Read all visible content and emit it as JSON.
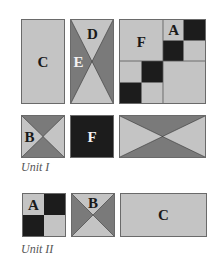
{
  "colors": {
    "light": "#c4c4c4",
    "medium": "#7a7a7a",
    "dark": "#1c1c1c",
    "border": "#6a6a6a"
  },
  "unit_1": {
    "caption": "Unit I",
    "blocks": {
      "c_rect": {
        "label": "C"
      },
      "hourglass_vertical": {
        "label_top": "D",
        "label_side": "E"
      },
      "grid": {
        "label_large": "F",
        "label_small": "A"
      },
      "b_square": {
        "label": "B"
      },
      "f_square": {
        "label": "F"
      },
      "hourglass_horizontal": {}
    }
  },
  "unit_2": {
    "caption": "Unit II",
    "blocks": {
      "a_four_patch": {
        "label": "A"
      },
      "b_square": {
        "label": "B"
      },
      "c_rect": {
        "label": "C"
      }
    }
  }
}
